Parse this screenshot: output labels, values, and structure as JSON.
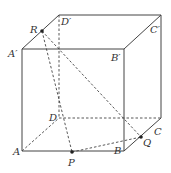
{
  "figure": {
    "type": "cube-diagram",
    "vertices": {
      "A": {
        "label": "A",
        "x": 22,
        "y": 151
      },
      "B": {
        "label": "B",
        "x": 124,
        "y": 151
      },
      "C": {
        "label": "C",
        "x": 161,
        "y": 118
      },
      "D": {
        "label": "D",
        "x": 59,
        "y": 118
      },
      "A1": {
        "label": "A′",
        "x": 22,
        "y": 49
      },
      "B1": {
        "label": "B′",
        "x": 124,
        "y": 49
      },
      "C1": {
        "label": "C′",
        "x": 161,
        "y": 15
      },
      "D1": {
        "label": "D′",
        "x": 59,
        "y": 15
      }
    },
    "points": {
      "R": {
        "label": "R",
        "on": "A′D′"
      },
      "P": {
        "label": "P",
        "on": "AB"
      },
      "Q": {
        "label": "Q",
        "on": "BC"
      }
    }
  }
}
